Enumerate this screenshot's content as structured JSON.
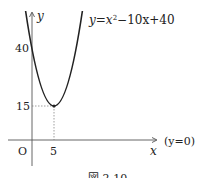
{
  "figure": {
    "equation": "y = x² − 10x + 40",
    "equation_parts": {
      "lhs": "y",
      "eq": "=",
      "x": "x",
      "sup": "2",
      "rest": "−10x+40"
    },
    "axis_labels": {
      "x": "x",
      "y": "y",
      "origin": "O"
    },
    "tick_labels": {
      "y40": "40",
      "y15": "15",
      "x5": "5"
    },
    "x_axis_note": "(y=0)",
    "caption": "図 2-10",
    "vertex": {
      "x": 5,
      "y": 15
    },
    "y_intercept": 40
  }
}
